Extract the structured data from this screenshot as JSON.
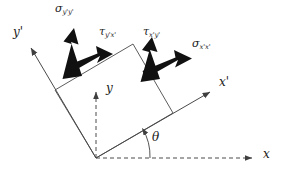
{
  "figure": {
    "type": "stress-transformation-diagram",
    "background_color": "#ffffff",
    "line_color": "#4a4a4a",
    "arrow_color": "#111111",
    "text_color": "#1a1a1a"
  },
  "axes": {
    "x": {
      "label": "x",
      "symbol": "x",
      "prime": "",
      "style": "dashed"
    },
    "y": {
      "label": "y",
      "symbol": "y",
      "prime": "",
      "style": "dashed"
    },
    "x_prime": {
      "label": "x'",
      "symbol": "x",
      "prime": "'",
      "style": "solid"
    },
    "y_prime": {
      "label": "y'",
      "symbol": "y",
      "prime": "'",
      "style": "solid"
    }
  },
  "angle": {
    "symbol": "θ",
    "label": "θ",
    "between": "x-axis and x'-axis",
    "value_deg": 29
  },
  "stresses": [
    {
      "name": "sigma-y-prime-y-prime",
      "symbol": "σ",
      "subscript": "y'y'",
      "kind": "normal",
      "face": "y-prime",
      "direction": "outward along y-prime"
    },
    {
      "name": "tau-y-prime-x-prime",
      "symbol": "τ",
      "subscript": "y'x'",
      "kind": "shear",
      "face": "y-prime",
      "direction": "along x-prime"
    },
    {
      "name": "tau-x-prime-y-prime",
      "symbol": "τ",
      "subscript": "x'y'",
      "kind": "shear",
      "face": "x-prime",
      "direction": "along y-prime"
    },
    {
      "name": "sigma-x-prime-x-prime",
      "symbol": "σ",
      "subscript": "x'x'",
      "kind": "normal",
      "face": "x-prime",
      "direction": "outward along x-prime"
    }
  ],
  "element": {
    "name": "rotated-stress-element",
    "shape": "square",
    "corners": [
      [
        96,
        158
      ],
      [
        173,
        113
      ],
      [
        133,
        44
      ],
      [
        55,
        90
      ]
    ]
  }
}
